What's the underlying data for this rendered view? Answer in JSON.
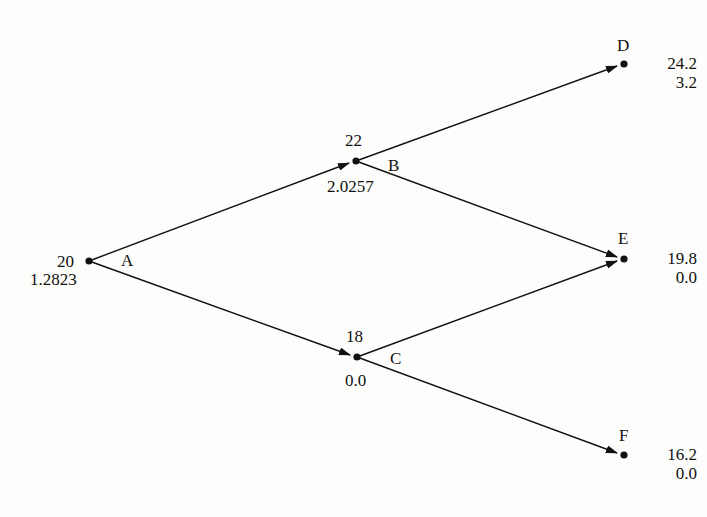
{
  "diagram": {
    "type": "binomial-tree",
    "nodes": {
      "A": {
        "label": "A",
        "price": "20",
        "value": "1.2823"
      },
      "B": {
        "label": "B",
        "price": "22",
        "value": "2.0257"
      },
      "C": {
        "label": "C",
        "price": "18",
        "value": "0.0"
      },
      "D": {
        "label": "D",
        "price": "24.2",
        "value": "3.2"
      },
      "E": {
        "label": "E",
        "price": "19.8",
        "value": "0.0"
      },
      "F": {
        "label": "F",
        "price": "16.2",
        "value": "0.0"
      }
    },
    "edges": [
      {
        "from": "A",
        "to": "B"
      },
      {
        "from": "A",
        "to": "C"
      },
      {
        "from": "B",
        "to": "D"
      },
      {
        "from": "B",
        "to": "E"
      },
      {
        "from": "C",
        "to": "E"
      },
      {
        "from": "C",
        "to": "F"
      }
    ],
    "colors": {
      "line": "#111111",
      "background": "#fdfdfb"
    }
  }
}
